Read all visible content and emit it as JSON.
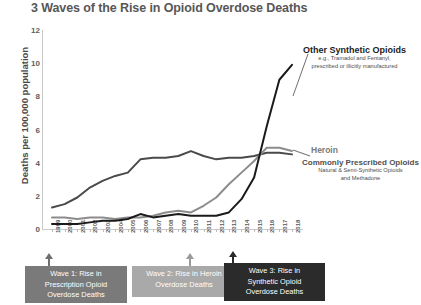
{
  "chart_data": {
    "type": "line",
    "title": "3 Waves of the Rise in Opioid Overdose Deaths",
    "xlabel": "",
    "ylabel": "Deaths per 100,000 population",
    "ylim": [
      0,
      12
    ],
    "yticks": [
      0,
      2,
      4,
      6,
      8,
      10,
      12
    ],
    "grid": false,
    "legend_position": "right-inline-annotations",
    "x": [
      1999,
      2000,
      2001,
      2002,
      2003,
      2004,
      2005,
      2006,
      2007,
      2008,
      2009,
      2010,
      2011,
      2012,
      2013,
      2014,
      2015,
      2016,
      2017,
      2018
    ],
    "categories": [
      "1999",
      "2000",
      "2001",
      "2002",
      "2003",
      "2004",
      "2005",
      "2006",
      "2007",
      "2008",
      "2009",
      "2010",
      "2011",
      "2012",
      "2013",
      "2014",
      "2015",
      "2016",
      "2017",
      "2018"
    ],
    "series": [
      {
        "name": "Commonly Prescribed Opioids",
        "color": "#4a4a4a",
        "values": [
          1.3,
          1.5,
          1.9,
          2.5,
          2.9,
          3.2,
          3.4,
          4.2,
          4.3,
          4.3,
          4.4,
          4.7,
          4.4,
          4.2,
          4.3,
          4.3,
          4.4,
          4.6,
          4.6,
          4.5
        ]
      },
      {
        "name": "Heroin",
        "color": "#8c8c8c",
        "values": [
          0.7,
          0.7,
          0.6,
          0.7,
          0.7,
          0.6,
          0.7,
          0.7,
          0.8,
          1.0,
          1.1,
          1.0,
          1.4,
          1.9,
          2.7,
          3.4,
          4.1,
          4.9,
          4.9,
          4.7
        ]
      },
      {
        "name": "Other Synthetic Opioids",
        "color": "#1a1a1a",
        "values": [
          0.3,
          0.3,
          0.3,
          0.4,
          0.5,
          0.5,
          0.6,
          0.9,
          0.7,
          0.8,
          0.9,
          0.8,
          0.8,
          0.8,
          1.0,
          1.8,
          3.1,
          6.2,
          9.0,
          9.9
        ]
      }
    ],
    "annotations": [
      {
        "id": "other-synthetic-opioids",
        "title": "Other Synthetic Opioids",
        "subtitle_line1": "e.g., Tramadol and Fentanyl,",
        "subtitle_line2": "prescribed or illicitly manufactured"
      },
      {
        "id": "heroin",
        "title": "Heroin"
      },
      {
        "id": "commonly-prescribed-opioids",
        "title": "Commonly Prescribed Opioids",
        "subtitle_line1": "Natural & Semi-Synthetic Opioids",
        "subtitle_line2": "and Methadone"
      }
    ],
    "waves": [
      {
        "id": "wave-1",
        "line1": "Wave 1: Rise in",
        "line2": "Prescription Opioid",
        "line3": "Overdose Deaths",
        "color": "#7a7a7a",
        "points_to_year": "1999"
      },
      {
        "id": "wave-2",
        "line1": "Wave 2: Rise in Heroin",
        "line2": "Overdose Deaths",
        "line3": "",
        "color": "#a9a9a9",
        "points_to_year": "2010"
      },
      {
        "id": "wave-3",
        "line1": "Wave 3: Rise in",
        "line2": "Synthetic Opioid",
        "line3": "Overdose Deaths",
        "color": "#2b2b2b",
        "points_to_year": "2013"
      }
    ]
  }
}
